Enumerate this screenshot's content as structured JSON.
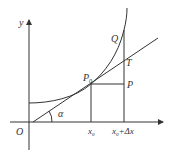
{
  "diagram": {
    "colors": {
      "stroke": "#333333",
      "background": "#ffffff"
    },
    "axes": {
      "x_label": "",
      "y_label": "y",
      "origin_label": "O"
    },
    "points": {
      "P0": "P",
      "P0_sub": "0",
      "P": "P",
      "Q": "Q",
      "T": "T"
    },
    "angle_label": "α",
    "x_ticks": {
      "x0": "x",
      "x0_sub": "0",
      "x0_dx_main": "x",
      "x0_dx_sub": "0",
      "x0_dx_rest": "+Δx"
    }
  }
}
